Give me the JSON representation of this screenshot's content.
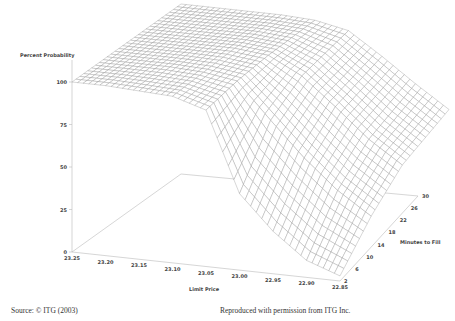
{
  "chart_data": {
    "type": "surface3d",
    "title": "",
    "zlabel": "Percent Probability",
    "xlabel": "Limit Price",
    "ylabel": "Minutes to Fill",
    "z_ticks": [
      "0",
      "25",
      "50",
      "75",
      "100"
    ],
    "zlim": [
      0,
      100
    ],
    "x_ticks": [
      "23.25",
      "23.20",
      "23.15",
      "23.10",
      "23.05",
      "23.00",
      "22.95",
      "22.90",
      "22.85"
    ],
    "y_ticks": [
      "2",
      "6",
      "10",
      "14",
      "18",
      "22",
      "26",
      "30"
    ],
    "x_range": [
      23.25,
      22.85
    ],
    "y_range": [
      2,
      30
    ],
    "grid": false,
    "legend": "none",
    "surface_description": "Probability of fill as function of limit price and minutes to fill; ~100% for limit prices 23.25 to ~23.05, drops sharply near 23.05-23.00, then declines gradually toward ~5% at 22.85 for short times; higher fill probability with more minutes.",
    "series": [
      {
        "name": "minutes=2",
        "x": [
          23.25,
          23.2,
          23.15,
          23.1,
          23.05,
          23.0,
          22.95,
          22.9,
          22.85
        ],
        "values": [
          100,
          100,
          99,
          98,
          92,
          45,
          25,
          10,
          3
        ]
      },
      {
        "name": "minutes=10",
        "x": [
          23.25,
          23.2,
          23.15,
          23.1,
          23.05,
          23.0,
          22.95,
          22.9,
          22.85
        ],
        "values": [
          100,
          100,
          100,
          99,
          96,
          75,
          55,
          38,
          25
        ]
      },
      {
        "name": "minutes=18",
        "x": [
          23.25,
          23.2,
          23.15,
          23.1,
          23.05,
          23.0,
          22.95,
          22.9,
          22.85
        ],
        "values": [
          100,
          100,
          100,
          100,
          98,
          88,
          72,
          55,
          42
        ]
      },
      {
        "name": "minutes=30",
        "x": [
          23.25,
          23.2,
          23.15,
          23.1,
          23.05,
          23.0,
          22.95,
          22.9,
          22.85
        ],
        "values": [
          100,
          100,
          100,
          100,
          99,
          95,
          82,
          68,
          55
        ]
      }
    ]
  },
  "footer": {
    "source": "Source: © ITG (2003)",
    "permission": "Reproduced with permission from ITG Inc."
  }
}
